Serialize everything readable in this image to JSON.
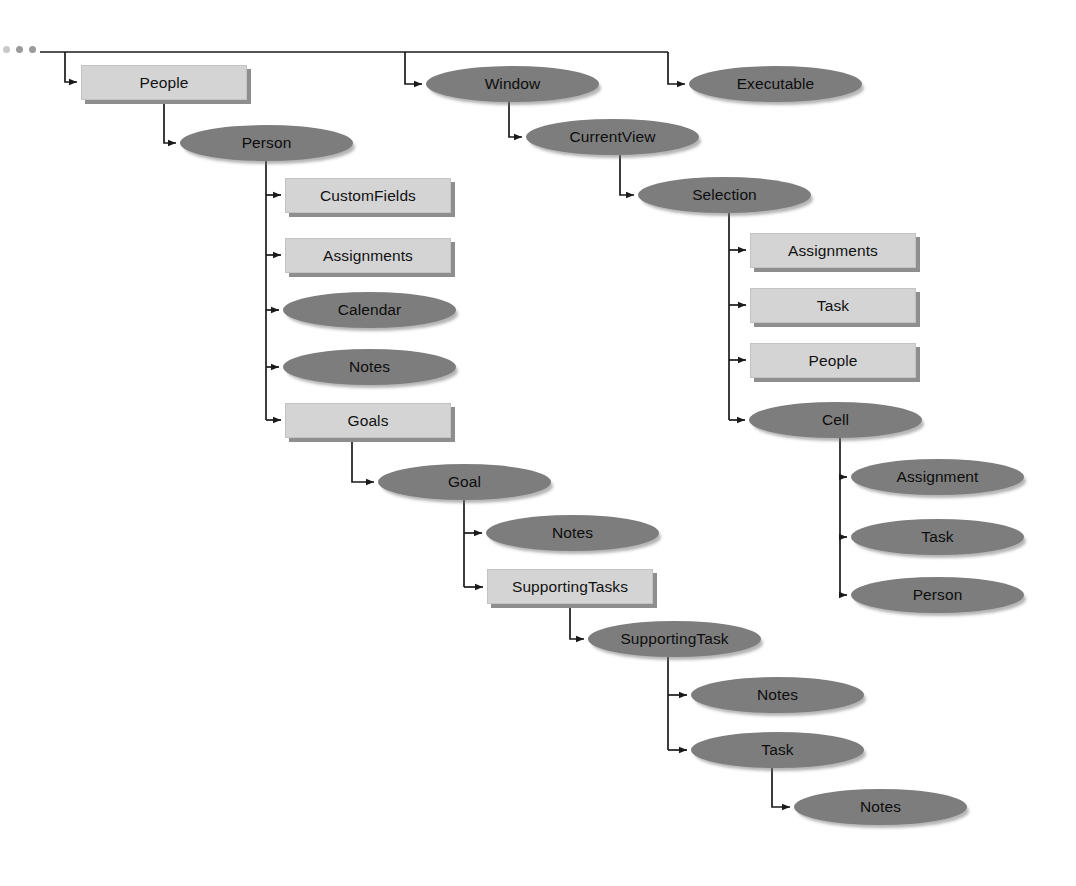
{
  "diagram": {
    "type": "tree-diagram",
    "legend": {
      "box_shape_meaning": "collection",
      "ellipse_shape_meaning": "object"
    },
    "truncation_indicator": "...",
    "colors": {
      "box_fill": "#d4d4d4",
      "box_shadow": "#8e8e8e",
      "ellipse_fill": "#7d7d7d",
      "connector": "#1a1a1a",
      "background": "#ffffff",
      "text": "#111111"
    }
  },
  "nodes": [
    {
      "id": "people",
      "label": "People",
      "shape": "box",
      "x": 81,
      "y": 65,
      "w": 166,
      "h": 35
    },
    {
      "id": "person",
      "label": "Person",
      "shape": "ellipse",
      "x": 180,
      "y": 125,
      "w": 173,
      "h": 36
    },
    {
      "id": "customfields",
      "label": "CustomFields",
      "shape": "box",
      "x": 285,
      "y": 178,
      "w": 166,
      "h": 35
    },
    {
      "id": "assignments-p",
      "label": "Assignments",
      "shape": "box",
      "x": 285,
      "y": 238,
      "w": 166,
      "h": 35
    },
    {
      "id": "calendar",
      "label": "Calendar",
      "shape": "ellipse",
      "x": 283,
      "y": 292,
      "w": 173,
      "h": 36
    },
    {
      "id": "notes-person",
      "label": "Notes",
      "shape": "ellipse",
      "x": 283,
      "y": 349,
      "w": 173,
      "h": 36
    },
    {
      "id": "goals",
      "label": "Goals",
      "shape": "box",
      "x": 285,
      "y": 403,
      "w": 166,
      "h": 35
    },
    {
      "id": "goal",
      "label": "Goal",
      "shape": "ellipse",
      "x": 378,
      "y": 464,
      "w": 173,
      "h": 36
    },
    {
      "id": "notes-goal",
      "label": "Notes",
      "shape": "ellipse",
      "x": 486,
      "y": 515,
      "w": 173,
      "h": 36
    },
    {
      "id": "supportingtasks",
      "label": "SupportingTasks",
      "shape": "box",
      "x": 487,
      "y": 569,
      "w": 166,
      "h": 35
    },
    {
      "id": "supportingtask",
      "label": "SupportingTask",
      "shape": "ellipse",
      "x": 588,
      "y": 621,
      "w": 173,
      "h": 36
    },
    {
      "id": "notes-st",
      "label": "Notes",
      "shape": "ellipse",
      "x": 691,
      "y": 677,
      "w": 173,
      "h": 36
    },
    {
      "id": "task-st",
      "label": "Task",
      "shape": "ellipse",
      "x": 691,
      "y": 732,
      "w": 173,
      "h": 36
    },
    {
      "id": "notes-task",
      "label": "Notes",
      "shape": "ellipse",
      "x": 794,
      "y": 789,
      "w": 173,
      "h": 36
    },
    {
      "id": "window",
      "label": "Window",
      "shape": "ellipse",
      "x": 426,
      "y": 66,
      "w": 173,
      "h": 36
    },
    {
      "id": "executable",
      "label": "Executable",
      "shape": "ellipse",
      "x": 689,
      "y": 66,
      "w": 173,
      "h": 36
    },
    {
      "id": "currentview",
      "label": "CurrentView",
      "shape": "ellipse",
      "x": 526,
      "y": 119,
      "w": 173,
      "h": 36
    },
    {
      "id": "selection",
      "label": "Selection",
      "shape": "ellipse",
      "x": 638,
      "y": 177,
      "w": 173,
      "h": 36
    },
    {
      "id": "assignments-s",
      "label": "Assignments",
      "shape": "box",
      "x": 750,
      "y": 233,
      "w": 166,
      "h": 35
    },
    {
      "id": "task-s",
      "label": "Task",
      "shape": "box",
      "x": 750,
      "y": 288,
      "w": 166,
      "h": 35
    },
    {
      "id": "people-s",
      "label": "People",
      "shape": "box",
      "x": 750,
      "y": 343,
      "w": 166,
      "h": 35
    },
    {
      "id": "cell",
      "label": "Cell",
      "shape": "ellipse",
      "x": 749,
      "y": 402,
      "w": 173,
      "h": 36
    },
    {
      "id": "assignment-c",
      "label": "Assignment",
      "shape": "ellipse",
      "x": 851,
      "y": 459,
      "w": 173,
      "h": 36
    },
    {
      "id": "task-c",
      "label": "Task",
      "shape": "ellipse",
      "x": 851,
      "y": 519,
      "w": 173,
      "h": 36
    },
    {
      "id": "person-c",
      "label": "Person",
      "shape": "ellipse",
      "x": 851,
      "y": 577,
      "w": 173,
      "h": 36
    }
  ],
  "edges": [
    {
      "from": "root-bus",
      "to": "people",
      "style": "elbow"
    },
    {
      "from": "root-bus",
      "to": "window",
      "style": "elbow"
    },
    {
      "from": "root-bus",
      "to": "executable",
      "style": "elbow"
    },
    {
      "from": "people",
      "to": "person",
      "style": "elbow"
    },
    {
      "from": "person",
      "to": "customfields",
      "style": "elbow"
    },
    {
      "from": "person",
      "to": "assignments-p",
      "style": "elbow"
    },
    {
      "from": "person",
      "to": "calendar",
      "style": "elbow"
    },
    {
      "from": "person",
      "to": "notes-person",
      "style": "elbow"
    },
    {
      "from": "person",
      "to": "goals",
      "style": "elbow"
    },
    {
      "from": "goals",
      "to": "goal",
      "style": "elbow"
    },
    {
      "from": "goal",
      "to": "notes-goal",
      "style": "elbow"
    },
    {
      "from": "goal",
      "to": "supportingtasks",
      "style": "elbow"
    },
    {
      "from": "supportingtasks",
      "to": "supportingtask",
      "style": "elbow"
    },
    {
      "from": "supportingtask",
      "to": "notes-st",
      "style": "elbow"
    },
    {
      "from": "supportingtask",
      "to": "task-st",
      "style": "elbow"
    },
    {
      "from": "task-st",
      "to": "notes-task",
      "style": "elbow"
    },
    {
      "from": "window",
      "to": "currentview",
      "style": "elbow"
    },
    {
      "from": "currentview",
      "to": "selection",
      "style": "elbow"
    },
    {
      "from": "selection",
      "to": "assignments-s",
      "style": "elbow"
    },
    {
      "from": "selection",
      "to": "task-s",
      "style": "elbow"
    },
    {
      "from": "selection",
      "to": "people-s",
      "style": "elbow"
    },
    {
      "from": "selection",
      "to": "cell",
      "style": "elbow"
    },
    {
      "from": "cell",
      "to": "assignment-c",
      "style": "elbow"
    },
    {
      "from": "cell",
      "to": "task-c",
      "style": "elbow"
    },
    {
      "from": "cell",
      "to": "person-c",
      "style": "elbow"
    }
  ]
}
